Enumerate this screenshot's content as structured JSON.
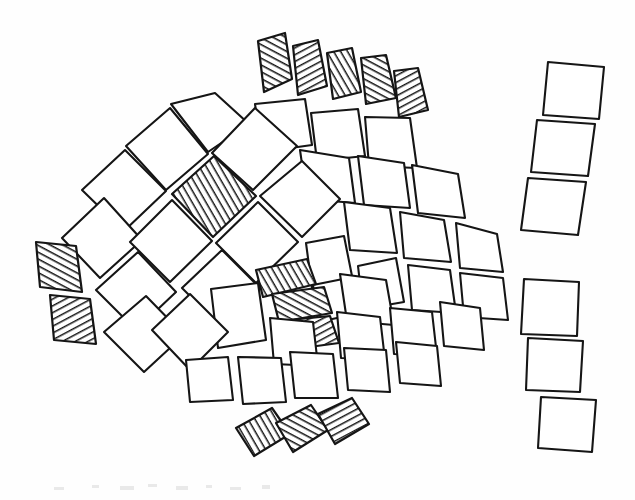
{
  "figure": {
    "medium": "pen-and-ink line drawing",
    "canvas": {
      "width": 635,
      "height": 500
    },
    "colors": {
      "background": "#fefefe",
      "stroke": "#151515",
      "tile_fill": "#ffffff",
      "hatch_stroke": "#151515"
    },
    "stroke_width": 2.1,
    "counts": {
      "total_tiles": 52,
      "plain_tiles": 38,
      "hatched_tiles": 14
    }
  },
  "groups": [
    {
      "id": "dorsal-fin",
      "label": "Dorsal fin",
      "hatched": true,
      "tile_count": 5
    },
    {
      "id": "body-scales",
      "label": "Body scales",
      "hatched": false,
      "tile_count": 34
    },
    {
      "id": "eye",
      "label": "Eye",
      "hatched": true,
      "tile_count": 1
    },
    {
      "id": "gill-plates",
      "label": "Gill plates",
      "hatched": true,
      "tile_count": 2
    },
    {
      "id": "mouth",
      "label": "Mouth",
      "hatched": true,
      "tile_count": 3
    },
    {
      "id": "ventral-fin",
      "label": "Ventral fin",
      "hatched": true,
      "tile_count": 3
    },
    {
      "id": "tail-upper",
      "label": "Upper tail lobe",
      "hatched": false,
      "tile_count": 3
    },
    {
      "id": "tail-lower",
      "label": "Lower tail lobe",
      "hatched": false,
      "tile_count": 3
    }
  ],
  "tiles": [
    {
      "g": "dorsal-fin",
      "h": true,
      "p": "258,41 285,33 292,79 264,92"
    },
    {
      "g": "dorsal-fin",
      "h": true,
      "p": "293,46 318,40 327,86 298,95"
    },
    {
      "g": "dorsal-fin",
      "h": true,
      "p": "327,53 352,48 361,92 333,99"
    },
    {
      "g": "dorsal-fin",
      "h": true,
      "p": "361,58 386,55 396,98 366,104"
    },
    {
      "g": "dorsal-fin",
      "h": true,
      "p": "394,71 418,68 428,110 399,117"
    },
    {
      "g": "body-scales",
      "h": false,
      "p": "171,104 215,93 249,124 208,152"
    },
    {
      "g": "body-scales",
      "h": false,
      "p": "255,104 305,99 312,145 262,152"
    },
    {
      "g": "body-scales",
      "h": false,
      "p": "311,113 358,109 365,156 317,161"
    },
    {
      "g": "body-scales",
      "h": false,
      "p": "365,117 410,118 417,168 369,166"
    },
    {
      "g": "body-scales",
      "h": false,
      "p": "126,146 170,108 208,154 166,190"
    },
    {
      "g": "body-scales",
      "h": false,
      "p": "212,153 255,108 297,146 253,190"
    },
    {
      "g": "body-scales",
      "h": false,
      "p": "300,150 349,158 355,203 307,199"
    },
    {
      "g": "body-scales",
      "h": false,
      "p": "358,156 404,163 410,208 364,205"
    },
    {
      "g": "body-scales",
      "h": false,
      "p": "412,165 458,174 465,218 418,213"
    },
    {
      "g": "eye",
      "h": true,
      "p": "172,194 214,156 256,196 213,237"
    },
    {
      "g": "body-scales",
      "h": false,
      "p": "82,190 125,150 166,191 124,231"
    },
    {
      "g": "body-scales",
      "h": false,
      "p": "260,196 302,161 340,199 302,237"
    },
    {
      "g": "body-scales",
      "h": false,
      "p": "344,202 390,208 397,253 350,250"
    },
    {
      "g": "body-scales",
      "h": false,
      "p": "400,212 444,220 451,262 404,258"
    },
    {
      "g": "body-scales",
      "h": false,
      "p": "456,223 497,234 503,272 460,268"
    },
    {
      "g": "body-scales",
      "h": false,
      "p": "62,238 104,198 142,240 100,278"
    },
    {
      "g": "body-scales",
      "h": false,
      "p": "130,242 172,200 212,241 170,282"
    },
    {
      "g": "body-scales",
      "h": false,
      "p": "216,243 258,202 298,242 256,283"
    },
    {
      "g": "body-scales",
      "h": false,
      "p": "306,243 344,236 353,281 312,288"
    },
    {
      "g": "body-scales",
      "h": false,
      "p": "313,285 348,278 356,314 318,322"
    },
    {
      "g": "body-scales",
      "h": false,
      "p": "358,266 396,258 404,302 363,309"
    },
    {
      "g": "body-scales",
      "h": false,
      "p": "408,265 450,270 456,313 412,310"
    },
    {
      "g": "body-scales",
      "h": false,
      "p": "460,273 503,278 508,320 464,317"
    },
    {
      "g": "gill-plates",
      "h": true,
      "p": "36,242 76,246 82,292 40,287"
    },
    {
      "g": "gill-plates",
      "h": true,
      "p": "50,295 90,299 96,344 54,340"
    },
    {
      "g": "mouth",
      "h": true,
      "p": "256,270 307,259 316,284 263,297"
    },
    {
      "g": "mouth",
      "h": true,
      "p": "272,294 324,287 332,313 279,322"
    },
    {
      "g": "mouth",
      "h": true,
      "p": "280,321 330,316 339,343 287,350"
    },
    {
      "g": "body-scales",
      "h": false,
      "p": "96,290 138,252 176,292 136,330"
    },
    {
      "g": "body-scales",
      "h": false,
      "p": "182,288 222,250 260,288 221,327"
    },
    {
      "g": "body-scales",
      "h": false,
      "p": "211,289 258,283 266,340 218,348"
    },
    {
      "g": "body-scales",
      "h": false,
      "p": "340,274 386,280 394,325 347,321"
    },
    {
      "g": "body-scales",
      "h": false,
      "p": "104,332 146,296 184,335 144,372"
    },
    {
      "g": "body-scales",
      "h": false,
      "p": "152,330 190,294 228,332 190,370"
    },
    {
      "g": "body-scales",
      "h": false,
      "p": "270,318 313,322 318,366 274,364"
    },
    {
      "g": "body-scales",
      "h": false,
      "p": "337,312 380,317 385,360 341,358"
    },
    {
      "g": "body-scales",
      "h": false,
      "p": "390,308 432,312 437,356 394,354"
    },
    {
      "g": "body-scales",
      "h": false,
      "p": "440,302 480,308 484,350 444,346"
    },
    {
      "g": "body-scales",
      "h": false,
      "p": "186,360 228,357 233,400 190,402"
    },
    {
      "g": "body-scales",
      "h": false,
      "p": "238,357 281,358 286,402 243,404"
    },
    {
      "g": "body-scales",
      "h": false,
      "p": "290,352 333,354 338,398 295,398"
    },
    {
      "g": "body-scales",
      "h": false,
      "p": "344,348 386,350 390,392 348,390"
    },
    {
      "g": "body-scales",
      "h": false,
      "p": "396,342 437,346 441,386 400,383"
    },
    {
      "g": "ventral-fin",
      "h": true,
      "p": "236,428 272,408 290,434 254,456"
    },
    {
      "g": "ventral-fin",
      "h": true,
      "p": "276,423 311,405 328,430 293,452"
    },
    {
      "g": "ventral-fin",
      "h": true,
      "p": "318,414 352,398 369,424 335,444"
    },
    {
      "g": "tail-upper",
      "h": false,
      "p": "548,62 604,67 599,119 543,115"
    },
    {
      "g": "tail-upper",
      "h": false,
      "p": "537,120 595,124 588,176 531,172"
    },
    {
      "g": "tail-upper",
      "h": false,
      "p": "528,178 586,182 578,235 521,230"
    },
    {
      "g": "tail-lower",
      "h": false,
      "p": "524,279 579,282 577,336 521,334"
    },
    {
      "g": "tail-lower",
      "h": false,
      "p": "528,338 583,341 580,392 526,390"
    },
    {
      "g": "tail-lower",
      "h": false,
      "p": "541,397 596,400 592,452 538,448"
    }
  ],
  "noise_marks": [
    {
      "x": 54,
      "y": 487,
      "w": 10,
      "h": 3
    },
    {
      "x": 92,
      "y": 485,
      "w": 7,
      "h": 3
    },
    {
      "x": 120,
      "y": 486,
      "w": 14,
      "h": 4
    },
    {
      "x": 148,
      "y": 484,
      "w": 9,
      "h": 3
    },
    {
      "x": 176,
      "y": 486,
      "w": 12,
      "h": 4
    },
    {
      "x": 206,
      "y": 485,
      "w": 6,
      "h": 3
    },
    {
      "x": 230,
      "y": 487,
      "w": 11,
      "h": 3
    },
    {
      "x": 262,
      "y": 485,
      "w": 8,
      "h": 4
    }
  ]
}
